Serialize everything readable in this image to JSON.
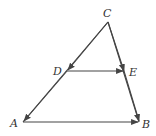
{
  "diagram": {
    "type": "triangle-vector-diagram",
    "points": {
      "A": {
        "label": "A",
        "x": 23,
        "y": 122
      },
      "B": {
        "label": "B",
        "x": 139,
        "y": 122
      },
      "C": {
        "label": "C",
        "x": 108,
        "y": 22
      },
      "D": {
        "label": "D",
        "x": 67,
        "y": 71
      },
      "E": {
        "label": "E",
        "x": 124,
        "y": 71
      }
    },
    "vectors": [
      {
        "from": "C",
        "to": "D"
      },
      {
        "from": "D",
        "to": "A"
      },
      {
        "from": "C",
        "to": "E"
      },
      {
        "from": "E",
        "to": "B"
      },
      {
        "from": "D",
        "to": "E"
      },
      {
        "from": "A",
        "to": "B"
      }
    ],
    "colors": {
      "line": "#444444",
      "label": "#333333"
    }
  }
}
